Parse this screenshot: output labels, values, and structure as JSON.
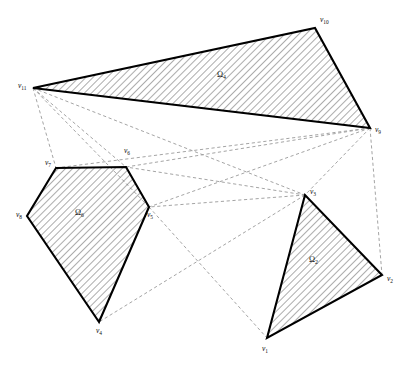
{
  "figure": {
    "background_color": "#ffffff",
    "stroke_color": "#000000",
    "dashed_color": "#9a9a9a",
    "hatch_color": "#3a3a3a",
    "width": 414,
    "height": 377
  },
  "vertices": [
    {
      "id": "v1",
      "label": "v",
      "sub": "1",
      "x": 267,
      "y": 338,
      "label_x": 262,
      "label_y": 351
    },
    {
      "id": "v2",
      "label": "v",
      "sub": "2",
      "x": 382,
      "y": 275,
      "label_x": 387,
      "label_y": 281
    },
    {
      "id": "v3",
      "label": "v",
      "sub": "3",
      "x": 305,
      "y": 195,
      "label_x": 310,
      "label_y": 194
    },
    {
      "id": "v4",
      "label": "v",
      "sub": "4",
      "x": 99,
      "y": 322,
      "label_x": 96,
      "label_y": 333
    },
    {
      "id": "v5",
      "label": "v",
      "sub": "5",
      "x": 149,
      "y": 207,
      "label_x": 147,
      "label_y": 217
    },
    {
      "id": "v6",
      "label": "v",
      "sub": "6",
      "x": 126,
      "y": 167,
      "label_x": 124,
      "label_y": 153
    },
    {
      "id": "v7",
      "label": "v",
      "sub": "7",
      "x": 56,
      "y": 168,
      "label_x": 45,
      "label_y": 165
    },
    {
      "id": "v8",
      "label": "v",
      "sub": "8",
      "x": 27,
      "y": 216,
      "label_x": 16,
      "label_y": 217
    },
    {
      "id": "v9",
      "label": "v",
      "sub": "9",
      "x": 370,
      "y": 128,
      "label_x": 375,
      "label_y": 132
    },
    {
      "id": "v10",
      "label": "v",
      "sub": "10",
      "x": 315,
      "y": 28,
      "label_x": 320,
      "label_y": 22
    },
    {
      "id": "v11",
      "label": "v",
      "sub": "11",
      "x": 33,
      "y": 88,
      "label_x": 18,
      "label_y": 88
    }
  ],
  "obstacles": [
    {
      "id": "omega2",
      "label": "Ω",
      "sub": "2",
      "label_x": 309,
      "label_y": 262,
      "vertex_ids": [
        "v1",
        "v3",
        "v2"
      ],
      "points": "267,338 305,195 382,275"
    },
    {
      "id": "omega6",
      "label": "Ω",
      "sub": "6",
      "label_x": 75,
      "label_y": 215,
      "vertex_ids": [
        "v4",
        "v8",
        "v7",
        "v6",
        "v5"
      ],
      "points": "99,322 27,216 56,168 126,167 149,207"
    },
    {
      "id": "omega4",
      "label": "Ω",
      "sub": "4",
      "label_x": 217,
      "label_y": 77,
      "vertex_ids": [
        "v11",
        "v10",
        "v9"
      ],
      "points": "33,88 315,28 370,128"
    }
  ],
  "visibility_edges": [
    {
      "from": "v11",
      "to": "v7"
    },
    {
      "from": "v11",
      "to": "v6"
    },
    {
      "from": "v11",
      "to": "v5"
    },
    {
      "from": "v11",
      "to": "v3"
    },
    {
      "from": "v11",
      "to": "v9"
    },
    {
      "from": "v9",
      "to": "v2"
    },
    {
      "from": "v9",
      "to": "v3"
    },
    {
      "from": "v9",
      "to": "v5"
    },
    {
      "from": "v9",
      "to": "v6"
    },
    {
      "from": "v9",
      "to": "v7"
    },
    {
      "from": "v3",
      "to": "v6"
    },
    {
      "from": "v3",
      "to": "v5"
    },
    {
      "from": "v3",
      "to": "v4"
    },
    {
      "from": "v5",
      "to": "v4"
    },
    {
      "from": "v5",
      "to": "v1"
    },
    {
      "from": "v6",
      "to": "v5"
    },
    {
      "from": "v10",
      "to": "v9"
    }
  ]
}
